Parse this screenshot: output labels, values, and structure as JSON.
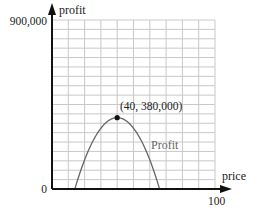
{
  "chart_data": {
    "type": "line",
    "title": "",
    "xlabel": "price",
    "ylabel": "profit",
    "xlim": [
      0,
      100
    ],
    "ylim": [
      0,
      900000
    ],
    "x_ticks": [
      {
        "value": 0,
        "label": "0"
      },
      {
        "value": 100,
        "label": "100"
      }
    ],
    "y_ticks": [
      {
        "value": 900000,
        "label": "900,000"
      }
    ],
    "grid": true,
    "grid_x_step": 10,
    "grid_y_step": 50000,
    "series": [
      {
        "name": "Profit",
        "shape": "downward parabola",
        "vertex": [
          40,
          380000
        ],
        "x": [
          14,
          20,
          25,
          30,
          35,
          40,
          45,
          50,
          55,
          60,
          66
        ],
        "values": [
          0,
          155000,
          253500,
          323800,
          366000,
          380000,
          366000,
          323800,
          253500,
          155000,
          0
        ]
      }
    ],
    "annotations": [
      {
        "text": "(40, 380,000)",
        "x": 40,
        "y": 380000,
        "marker": "dot"
      },
      {
        "text": "Profit",
        "near": "curve right side"
      }
    ],
    "legend": "none"
  },
  "labels": {
    "y_axis": "profit",
    "x_axis": "price",
    "y_max": "900,000",
    "origin": "0",
    "x_max": "100",
    "vertex": "(40, 380,000)",
    "curve": "Profit"
  },
  "colors": {
    "axis": "#111111",
    "grid": "#c8c8c8",
    "curve": "#666666",
    "text": "#222222"
  }
}
